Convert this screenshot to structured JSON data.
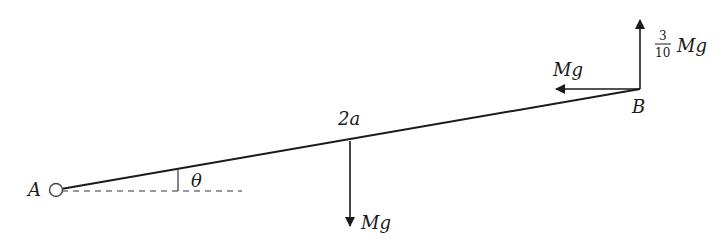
{
  "diagram": {
    "type": "statics free-body diagram",
    "colors": {
      "ink": "#1a1a1a",
      "background": "#ffffff"
    },
    "points": {
      "A": {
        "label": "A",
        "note": "hinge (small circle)"
      },
      "B": {
        "label": "B"
      }
    },
    "rod": {
      "length_label": "2a"
    },
    "angle": {
      "label": "θ",
      "between": "rod and horizontal dashed line at A"
    },
    "forces": [
      {
        "id": "weight",
        "label": "Mg",
        "direction": "down",
        "at": "midpoint of rod"
      },
      {
        "id": "horizontal_at_B",
        "label": "Mg",
        "direction": "left",
        "at": "B"
      },
      {
        "id": "vertical_at_B",
        "label": "Mg",
        "coefficient_numerator": "3",
        "coefficient_denominator": "10",
        "direction": "up",
        "at": "B"
      }
    ]
  }
}
